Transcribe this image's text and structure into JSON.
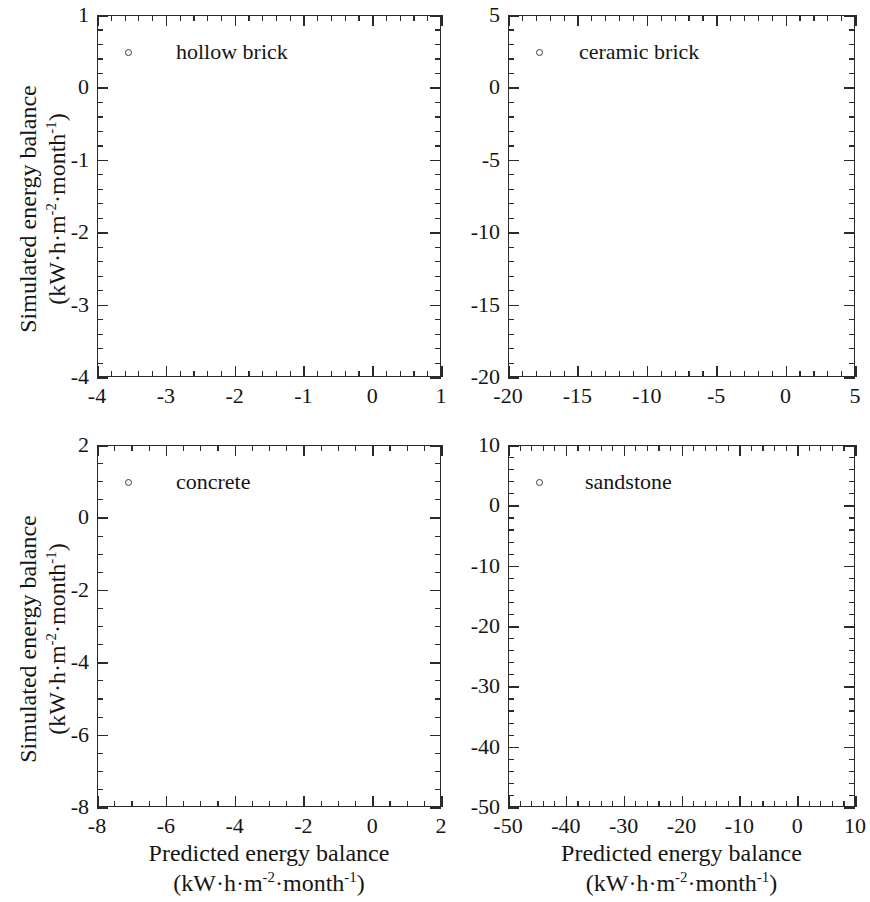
{
  "figure": {
    "background": "#ffffff",
    "axis_color": "#2a2a2a",
    "x_axis_title_line1": "Predicted energy balance",
    "x_axis_title_line2_prefix": "(kW·h·m",
    "x_axis_title_line2_sup1": "-2",
    "x_axis_title_line2_mid": "·month",
    "x_axis_title_line2_sup2": "-1",
    "x_axis_title_line2_suffix": ")",
    "y_axis_title_line1": "Simulated energy balance",
    "y_axis_title_line2_prefix": "(kW·h·m",
    "y_axis_title_line2_sup1": "-2",
    "y_axis_title_line2_mid": "·month",
    "y_axis_title_line2_sup2": "-1",
    "y_axis_title_line2_suffix": ")"
  },
  "chart_data": [
    {
      "id": "hollow-brick",
      "type": "scatter",
      "title": "",
      "legend_label": "hollow brick",
      "legend_position": "top-left",
      "xlabel": "Predicted energy balance (kW·h·m-2·month-1)",
      "ylabel": "Simulated energy balance (kW·h·m-2·month-1)",
      "xlim": [
        -4,
        1
      ],
      "ylim": [
        -4,
        1
      ],
      "xticks": [
        -4,
        -3,
        -2,
        -1,
        0,
        1
      ],
      "yticks": [
        -4,
        -3,
        -2,
        -1,
        0,
        1
      ],
      "xticklabels": [
        "-4",
        "-3",
        "-2",
        "-1",
        "0",
        "1"
      ],
      "yticklabels": [
        "-4",
        "-3",
        "-2",
        "-1",
        "0",
        "1"
      ],
      "minor_subdivisions": 5,
      "grid": false,
      "marker_color": "#5b3024",
      "marker_edge": "#2e1711",
      "reference_line": {
        "type": "1:1 identity",
        "style": "dashed",
        "color": "#333333"
      },
      "n_points": 740,
      "cluster": {
        "x_min": -3.5,
        "x_max": 0.35,
        "slope": 1.0,
        "intercept": 0.0,
        "noise_sd": 0.065,
        "density_skew": 2.0
      },
      "outliers": [
        [
          -3.5,
          -3.33
        ],
        [
          -2.45,
          -2.63
        ],
        [
          -1.35,
          -1.4
        ],
        [
          -1.2,
          -0.88
        ],
        [
          -0.6,
          -1.82
        ],
        [
          -2.6,
          -2.85
        ],
        [
          -0.35,
          -0.33
        ]
      ]
    },
    {
      "id": "ceramic-brick",
      "type": "scatter",
      "title": "",
      "legend_label": "ceramic brick",
      "legend_position": "top-left",
      "xlabel": "Predicted energy balance (kW·h·m-2·month-1)",
      "ylabel": "Simulated energy balance (kW·h·m-2·month-1)",
      "xlim": [
        -20,
        5
      ],
      "ylim": [
        -20,
        5
      ],
      "xticks": [
        -20,
        -15,
        -10,
        -5,
        0,
        5
      ],
      "yticks": [
        -20,
        -15,
        -10,
        -5,
        0,
        5
      ],
      "xticklabels": [
        "-20",
        "-15",
        "-10",
        "-5",
        "0",
        "5"
      ],
      "yticklabels": [
        "-20",
        "-15",
        "-10",
        "-5",
        "0",
        "5"
      ],
      "minor_subdivisions": 5,
      "grid": false,
      "marker_color": "#3c4a47",
      "marker_edge": "#1f2a28",
      "reference_line": {
        "type": "1:1 identity",
        "style": "dashed",
        "color": "#333333"
      },
      "n_points": 700,
      "cluster": {
        "x_min": -19.3,
        "x_max": 1.9,
        "slope": 1.0,
        "intercept": 0.0,
        "noise_sd": 0.25,
        "density_skew": 1.35
      },
      "outliers": [
        [
          -10.0,
          -11.15
        ],
        [
          -17.2,
          -18.1
        ],
        [
          -6.6,
          -5.75
        ],
        [
          -12.0,
          -11.0
        ]
      ]
    },
    {
      "id": "concrete",
      "type": "scatter",
      "title": "",
      "legend_label": "concrete",
      "legend_position": "top-left",
      "xlabel": "Predicted energy balance (kW·h·m-2·month-1)",
      "ylabel": "Simulated energy balance (kW·h·m-2·month-1)",
      "xlim": [
        -8,
        2
      ],
      "ylim": [
        -8,
        2
      ],
      "xticks": [
        -8,
        -6,
        -4,
        -2,
        0,
        2
      ],
      "yticks": [
        -8,
        -6,
        -4,
        -2,
        0,
        2
      ],
      "xticklabels": [
        "-8",
        "-6",
        "-4",
        "-2",
        "0",
        "2"
      ],
      "yticklabels": [
        "-8",
        "-6",
        "-4",
        "-2",
        "0",
        "2"
      ],
      "minor_subdivisions": 4,
      "grid": false,
      "marker_color": "#2c1c18",
      "marker_edge": "#150c0a",
      "reference_line": {
        "type": "1:1 identity",
        "style": "dashed",
        "color": "#333333"
      },
      "n_points": 760,
      "cluster": {
        "x_min": -6.7,
        "x_max": 0.7,
        "slope": 1.0,
        "intercept": 0.0,
        "noise_sd": 0.1,
        "density_skew": 1.7
      },
      "outliers": [
        [
          -6.6,
          -6.6
        ],
        [
          -1.0,
          -0.55
        ],
        [
          -1.9,
          -2.25
        ],
        [
          -3.1,
          -3.3
        ],
        [
          -4.4,
          -3.65
        ]
      ]
    },
    {
      "id": "sandstone",
      "type": "scatter",
      "title": "",
      "legend_label": "sandstone",
      "legend_position": "top-left",
      "xlabel": "Predicted energy balance (kW·h·m-2·month-1)",
      "ylabel": "Simulated energy balance (kW·h·m-2·month-1)",
      "xlim": [
        -50,
        10
      ],
      "ylim": [
        -50,
        10
      ],
      "xticks": [
        -50,
        -40,
        -30,
        -20,
        -10,
        0,
        10
      ],
      "yticks": [
        -50,
        -40,
        -30,
        -20,
        -10,
        0,
        10
      ],
      "xticklabels": [
        "-50",
        "-40",
        "-30",
        "-20",
        "-10",
        "0",
        "10"
      ],
      "yticklabels": [
        "-50",
        "-40",
        "-30",
        "-20",
        "-10",
        "0",
        "10"
      ],
      "minor_subdivisions": 5,
      "grid": false,
      "marker_color": "#6d661f",
      "marker_edge": "#3b3710",
      "reference_line": {
        "type": "1:1 identity",
        "style": "dashed",
        "color": "#333333"
      },
      "n_points": 720,
      "cluster": {
        "x_min": -46.5,
        "x_max": 4.0,
        "slope": 1.0,
        "intercept": 0.0,
        "noise_sd": 0.55,
        "density_skew": 1.3
      },
      "outliers": [
        [
          -45.5,
          -46.3
        ],
        [
          -15.0,
          -13.5
        ],
        [
          -27.0,
          -26.0
        ],
        [
          9.6,
          9.7
        ]
      ]
    }
  ]
}
